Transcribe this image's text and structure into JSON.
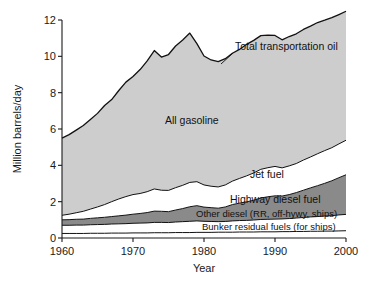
{
  "chart_data": {
    "type": "area",
    "stacked": true,
    "title": "",
    "xlabel": "Year",
    "ylabel": "Million barrels/day",
    "xlim": [
      1960,
      2000
    ],
    "ylim": [
      0,
      12
    ],
    "xticks": [
      1960,
      1970,
      1980,
      1990,
      2000
    ],
    "xtick_labels": [
      "1960",
      "1970",
      "1980",
      "1990",
      "2000"
    ],
    "yticks": [
      0,
      2,
      4,
      6,
      8,
      10,
      12
    ],
    "ytick_labels": [
      "0",
      "2",
      "4",
      "6",
      "8",
      "10",
      "12"
    ],
    "grid": false,
    "legend": "inline-labels",
    "x": [
      1960,
      1961,
      1962,
      1963,
      1964,
      1965,
      1966,
      1967,
      1968,
      1969,
      1970,
      1971,
      1972,
      1973,
      1974,
      1975,
      1976,
      1977,
      1978,
      1979,
      1980,
      1981,
      1982,
      1983,
      1984,
      1985,
      1986,
      1987,
      1988,
      1989,
      1990,
      1991,
      1992,
      1993,
      1994,
      1995,
      1996,
      1997,
      1998,
      1999,
      2000
    ],
    "series": [
      {
        "name": "Bunker residual fuels (for ships)",
        "color": "#ffffff",
        "values": [
          0.25,
          0.25,
          0.25,
          0.25,
          0.26,
          0.26,
          0.26,
          0.27,
          0.27,
          0.27,
          0.28,
          0.28,
          0.28,
          0.29,
          0.29,
          0.29,
          0.3,
          0.3,
          0.3,
          0.31,
          0.31,
          0.31,
          0.32,
          0.32,
          0.32,
          0.33,
          0.33,
          0.33,
          0.34,
          0.34,
          0.34,
          0.35,
          0.35,
          0.36,
          0.36,
          0.37,
          0.37,
          0.38,
          0.38,
          0.39,
          0.4
        ]
      },
      {
        "name": "Other diesel (RR, off-hywy, ships)",
        "color": "#ffffff",
        "values": [
          0.45,
          0.45,
          0.46,
          0.46,
          0.47,
          0.48,
          0.49,
          0.5,
          0.51,
          0.52,
          0.53,
          0.54,
          0.55,
          0.57,
          0.57,
          0.56,
          0.58,
          0.6,
          0.62,
          0.63,
          0.61,
          0.6,
          0.58,
          0.59,
          0.62,
          0.63,
          0.64,
          0.66,
          0.68,
          0.69,
          0.7,
          0.7,
          0.72,
          0.74,
          0.77,
          0.79,
          0.81,
          0.83,
          0.85,
          0.88,
          0.9
        ]
      },
      {
        "name": "Highway diesel fuel",
        "color": "#8a8a8a",
        "values": [
          0.3,
          0.31,
          0.32,
          0.33,
          0.35,
          0.37,
          0.39,
          0.41,
          0.44,
          0.47,
          0.5,
          0.53,
          0.57,
          0.62,
          0.61,
          0.6,
          0.66,
          0.72,
          0.8,
          0.84,
          0.78,
          0.76,
          0.74,
          0.8,
          0.9,
          0.96,
          1.02,
          1.09,
          1.18,
          1.24,
          1.28,
          1.26,
          1.32,
          1.4,
          1.5,
          1.6,
          1.7,
          1.8,
          1.92,
          2.05,
          2.18
        ]
      },
      {
        "name": "Jet fuel",
        "color": "#ffffff",
        "values": [
          0.25,
          0.3,
          0.36,
          0.43,
          0.51,
          0.6,
          0.7,
          0.82,
          0.93,
          1.02,
          1.08,
          1.1,
          1.15,
          1.22,
          1.16,
          1.17,
          1.23,
          1.28,
          1.34,
          1.32,
          1.22,
          1.18,
          1.17,
          1.21,
          1.29,
          1.36,
          1.43,
          1.5,
          1.58,
          1.6,
          1.62,
          1.55,
          1.58,
          1.6,
          1.66,
          1.7,
          1.76,
          1.8,
          1.82,
          1.86,
          1.9
        ]
      },
      {
        "name": "All gasoline",
        "color": "#cdcdcd",
        "values": [
          4.25,
          4.38,
          4.55,
          4.72,
          4.93,
          5.15,
          5.45,
          5.62,
          5.97,
          6.3,
          6.5,
          6.82,
          7.2,
          7.62,
          7.33,
          7.48,
          7.8,
          8.0,
          8.22,
          7.6,
          7.1,
          6.95,
          6.9,
          6.95,
          7.04,
          7.1,
          7.24,
          7.3,
          7.36,
          7.3,
          7.21,
          7.05,
          7.12,
          7.14,
          7.19,
          7.2,
          7.22,
          7.18,
          7.16,
          7.12,
          7.1
        ]
      }
    ],
    "total_series": {
      "name": "Total transportation oil",
      "values": [
        5.5,
        5.69,
        5.94,
        6.19,
        6.52,
        6.86,
        7.29,
        7.62,
        8.12,
        8.58,
        8.89,
        9.27,
        9.75,
        10.32,
        9.96,
        10.1,
        10.57,
        10.9,
        11.28,
        10.7,
        10.02,
        9.8,
        9.71,
        9.87,
        10.17,
        10.38,
        10.66,
        10.88,
        11.14,
        11.17,
        11.15,
        10.91,
        11.09,
        11.24,
        11.48,
        11.66,
        11.86,
        11.99,
        12.13,
        12.3,
        12.48
      ]
    },
    "annotations": [
      {
        "name": "total-transportation-oil",
        "text": "Total transportation oil"
      },
      {
        "name": "all-gasoline",
        "text": "All gasoline"
      },
      {
        "name": "jet-fuel",
        "text": "Jet fuel"
      },
      {
        "name": "highway-diesel-fuel",
        "text": "Highway diesel fuel"
      },
      {
        "name": "other-diesel",
        "text": "Other diesel (RR, off-hywy, ships)"
      },
      {
        "name": "bunker-residual",
        "text": "Bunker residual fuels (for ships)"
      }
    ],
    "colors": {
      "gasoline_fill": "#cdcdcd",
      "highway_diesel_fill": "#8a8a8a",
      "white_fill": "#ffffff",
      "outline": "#111111",
      "axis": "#1a1a1a"
    }
  },
  "labels": {
    "ylabel": "Million barrels/day",
    "xlabel": "Year",
    "total": "Total transportation oil",
    "gasoline": "All gasoline",
    "jet": "Jet fuel",
    "highway_diesel": "Highway diesel fuel",
    "other_diesel": "Other diesel (RR, off-hywy, ships)",
    "bunker": "Bunker residual fuels (for ships)",
    "y0": "0",
    "y2": "2",
    "y4": "4",
    "y6": "6",
    "y8": "8",
    "y10": "10",
    "y12": "12",
    "x1960": "1960",
    "x1970": "1970",
    "x1980": "1980",
    "x1990": "1990",
    "x2000": "2000"
  }
}
